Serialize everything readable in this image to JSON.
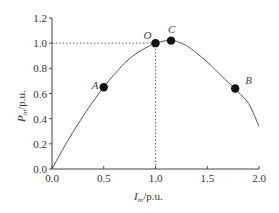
{
  "chart_data": {
    "type": "line",
    "title": "",
    "xlabel": "I_in/p.u.",
    "ylabel": "P_in/p.u.",
    "xlabel_main": "I",
    "xlabel_sub": "in",
    "xlabel_unit": "/p.u.",
    "ylabel_main": "P",
    "ylabel_sub": "in",
    "ylabel_unit": "/p.u.",
    "xlim": [
      0.0,
      2.0
    ],
    "ylim": [
      0.0,
      1.2
    ],
    "xticks": [
      "0.0",
      "0.5",
      "1.0",
      "1.5",
      "2.0"
    ],
    "yticks": [
      "0.0",
      "0.2",
      "0.4",
      "0.6",
      "0.8",
      "1.0",
      "1.2"
    ],
    "grid": false,
    "legend": null,
    "series": [
      {
        "name": "P_in vs I_in",
        "x": [
          0.0,
          0.1,
          0.2,
          0.3,
          0.4,
          0.5,
          0.6,
          0.7,
          0.8,
          0.9,
          1.0,
          1.1,
          1.15,
          1.2,
          1.3,
          1.4,
          1.5,
          1.6,
          1.7,
          1.77,
          1.8,
          1.9,
          2.0
        ],
        "y": [
          0.0,
          0.15,
          0.29,
          0.42,
          0.54,
          0.65,
          0.75,
          0.84,
          0.91,
          0.96,
          1.0,
          1.02,
          1.02,
          1.015,
          0.98,
          0.92,
          0.85,
          0.77,
          0.69,
          0.64,
          0.61,
          0.52,
          0.34
        ]
      }
    ],
    "points": [
      {
        "label": "A",
        "x": 0.5,
        "y": 0.65
      },
      {
        "label": "O",
        "x": 1.0,
        "y": 1.0
      },
      {
        "label": "C",
        "x": 1.15,
        "y": 1.02
      },
      {
        "label": "B",
        "x": 1.77,
        "y": 0.64
      }
    ],
    "annotations": [
      {
        "type": "dotted-reference",
        "from": [
          0.0,
          1.0
        ],
        "to": [
          1.0,
          1.0
        ]
      },
      {
        "type": "dotted-reference",
        "from": [
          1.0,
          0.0
        ],
        "to": [
          1.0,
          1.0
        ]
      }
    ]
  }
}
